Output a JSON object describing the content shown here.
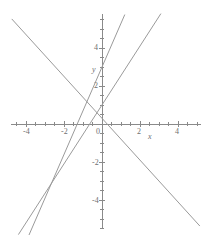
{
  "chart_data": {
    "type": "line",
    "title": "",
    "subtitle": "",
    "xlabel": "x",
    "ylabel": "y",
    "xlim": [
      -4.8,
      5.2
    ],
    "ylim": [
      -5.5,
      5.8
    ],
    "grid": false,
    "legend": null,
    "x_ticks": [
      -4,
      -2,
      0,
      2,
      4
    ],
    "x_tick_labels": [
      "-4",
      "-2",
      "0",
      "2",
      "4"
    ],
    "y_ticks": [
      -4,
      -2,
      2,
      4
    ],
    "y_tick_labels": [
      "-4",
      "-2",
      "2",
      "4"
    ],
    "minor_tick_step": 0.5,
    "line_color": "#9a9a9a",
    "axis_color": "#8a8a8a",
    "text_color": "#6f6f6f",
    "series": [
      {
        "name": "line-descending",
        "slope": -1.1,
        "intercept": 0.3,
        "x": [
          -4.75,
          5.15
        ],
        "y": [
          5.53,
          -5.37
        ],
        "color": "#9a9a9a"
      },
      {
        "name": "line-steep-ascending",
        "slope": 2.3,
        "intercept": 3.0,
        "x": [
          -3.85,
          1.2
        ],
        "y": [
          -5.86,
          5.76
        ],
        "color": "#9a9a9a"
      },
      {
        "name": "line-ascending",
        "slope": 1.55,
        "intercept": 1.0,
        "x": [
          -4.4,
          3.1
        ],
        "y": [
          -5.82,
          5.81
        ],
        "color": "#9a9a9a"
      }
    ],
    "origin_px": {
      "x": 102,
      "y": 124
    },
    "px_per_unit": 19
  }
}
